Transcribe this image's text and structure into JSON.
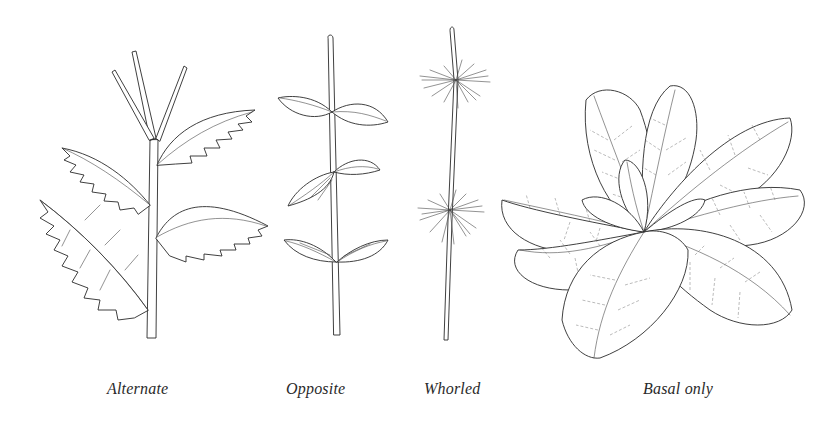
{
  "figure": {
    "panels": [
      {
        "id": "alternate",
        "label": "Alternate",
        "description": "Stem with serrated leaves arranged singly at alternating nodes"
      },
      {
        "id": "opposite",
        "label": "Opposite",
        "description": "Stem with paired leaves at each node"
      },
      {
        "id": "whorled",
        "label": "Whorled",
        "description": "Stem with rings of narrow leaves at two nodes"
      },
      {
        "id": "basal",
        "label": "Basal only",
        "description": "Rosette of broad leaves radiating from base"
      }
    ],
    "colors": {
      "ink": "#2a2a2a",
      "background": "#ffffff"
    }
  }
}
